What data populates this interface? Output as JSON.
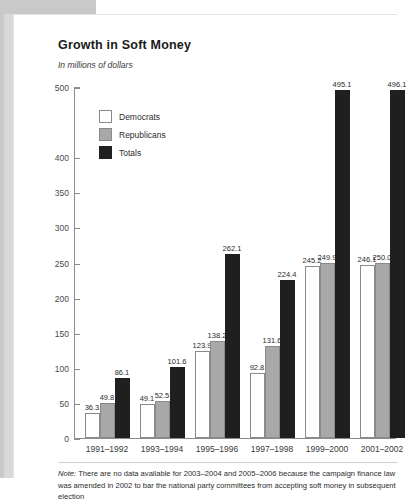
{
  "header": {
    "title": "Growth in Soft Money",
    "subtitle": "In millions of dollars"
  },
  "legend": {
    "items": [
      {
        "label": "Democrats",
        "color": "#ffffff",
        "key": "dem"
      },
      {
        "label": "Republicans",
        "color": "#a8a8a8",
        "key": "rep"
      },
      {
        "label": "Totals",
        "color": "#201f1f",
        "key": "tot"
      }
    ]
  },
  "footnote": {
    "note_prefix": "Note:",
    "text": " There are no data available for 2003–2004 and 2005–2006 because the campaign finance law was amended in 2002 to bar the national party committees from accepting soft money in subsequent election"
  },
  "chart_data": {
    "type": "bar",
    "title": "Growth in Soft Money",
    "subtitle": "In millions of dollars",
    "xlabel": "",
    "ylabel": "",
    "ylim": [
      0,
      500
    ],
    "yticks": [
      0,
      50,
      100,
      150,
      200,
      250,
      300,
      350,
      400,
      500
    ],
    "ytick_labels": [
      "0",
      "50",
      "100",
      "150",
      "200",
      "250",
      "300",
      "350",
      "400",
      "500"
    ],
    "grid": false,
    "legend_position": "upper-left-inside",
    "categories": [
      "1991–1992",
      "1993–1994",
      "1995–1996",
      "1997–1998",
      "1999–2000",
      "2001–2002"
    ],
    "series": [
      {
        "name": "Democrats",
        "color": "#ffffff",
        "values": [
          36.3,
          49.1,
          123.9,
          92.8,
          245.2,
          246.1
        ],
        "labels": [
          "36.3",
          "49.1",
          "123.9",
          "92.8",
          "245.2",
          "246.1"
        ]
      },
      {
        "name": "Republicans",
        "color": "#a8a8a8",
        "values": [
          49.8,
          52.5,
          138.2,
          131.6,
          249.9,
          250.0
        ],
        "labels": [
          "49.8",
          "52.5",
          "138.2",
          "131.6",
          "249.9",
          "250.0"
        ]
      },
      {
        "name": "Totals",
        "color": "#201f1f",
        "values": [
          86.1,
          101.6,
          262.1,
          224.4,
          495.1,
          496.1
        ],
        "labels": [
          "86.1",
          "101.6",
          "262.1",
          "224.4",
          "495.1",
          "496.1"
        ]
      }
    ]
  }
}
